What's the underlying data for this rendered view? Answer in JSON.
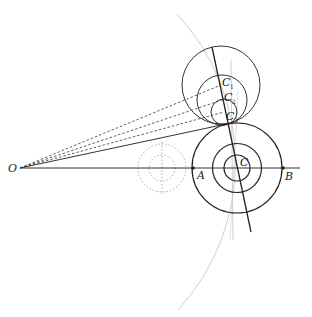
{
  "diagram": {
    "labels": {
      "O": "O",
      "A": "A",
      "B": "B",
      "C": "C",
      "C1": "C",
      "C1_sub": "1",
      "C2": "C",
      "C2_sub": "2",
      "C3": "C",
      "C3_sub": "3"
    },
    "points": {
      "O": [
        20,
        168
      ],
      "A": [
        193,
        168
      ],
      "B": [
        283,
        168
      ],
      "C": [
        237,
        168
      ]
    },
    "circles": {
      "lower_concentric_center": [
        237,
        168
      ],
      "lower_concentric_radii": [
        45,
        24.5,
        13
      ],
      "upper_circles": [
        {
          "name": "C1",
          "center": [
            221,
            85
          ],
          "r": 39
        },
        {
          "name": "C2",
          "center": [
            222,
            100
          ],
          "r": 25
        },
        {
          "name": "C3",
          "center": [
            224,
            112
          ],
          "r": 13
        }
      ],
      "dotted_concentric_center": [
        162,
        168
      ],
      "dotted_radii": [
        24,
        13
      ],
      "arc_center": [
        20,
        168
      ],
      "arc_radius": 218
    },
    "colors": {
      "stroke": "#222222",
      "arc": "#c8c8c8",
      "dotted": "#aaaaaa"
    }
  }
}
